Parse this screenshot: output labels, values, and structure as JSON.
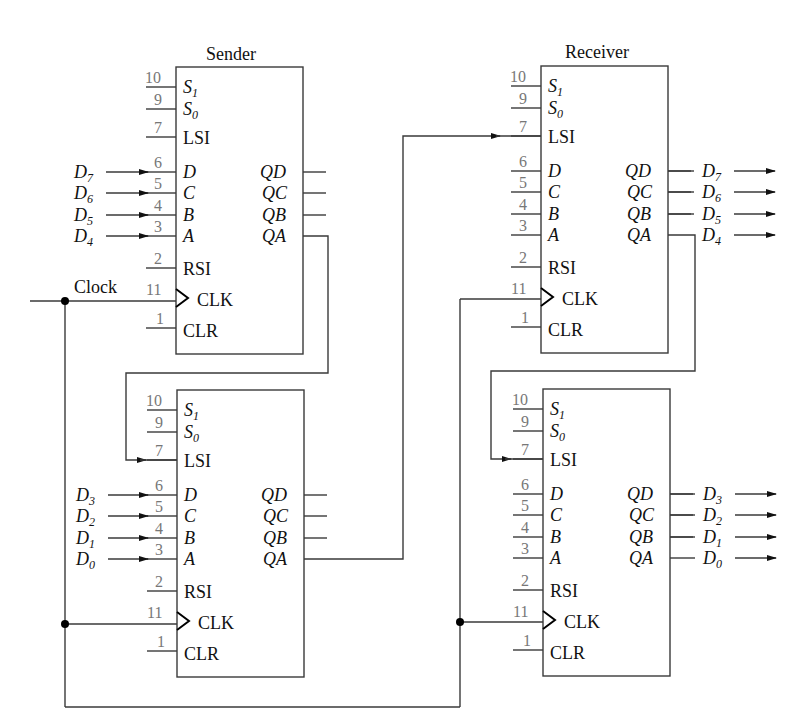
{
  "diagram": {
    "clock_label": "Clock",
    "sender": {
      "title": "Sender",
      "upper": {
        "inputs": [
          {
            "pin": "10",
            "name": "S",
            "sub": "1"
          },
          {
            "pin": "9",
            "name": "S",
            "sub": "0"
          },
          {
            "pin": "7",
            "name": "LSI"
          },
          {
            "pin": "6",
            "name": "D"
          },
          {
            "pin": "5",
            "name": "C"
          },
          {
            "pin": "4",
            "name": "B"
          },
          {
            "pin": "3",
            "name": "A"
          },
          {
            "pin": "2",
            "name": "RSI"
          },
          {
            "pin": "11",
            "name": "CLK"
          },
          {
            "pin": "1",
            "name": "CLR"
          }
        ],
        "outputs": [
          "QD",
          "QC",
          "QB",
          "QA"
        ],
        "data_in": [
          {
            "name": "D",
            "sub": "7"
          },
          {
            "name": "D",
            "sub": "6"
          },
          {
            "name": "D",
            "sub": "5"
          },
          {
            "name": "D",
            "sub": "4"
          }
        ]
      },
      "lower": {
        "data_in": [
          {
            "name": "D",
            "sub": "3"
          },
          {
            "name": "D",
            "sub": "2"
          },
          {
            "name": "D",
            "sub": "1"
          },
          {
            "name": "D",
            "sub": "0"
          }
        ]
      }
    },
    "receiver": {
      "title": "Receiver",
      "upper": {
        "data_out": [
          {
            "name": "D",
            "sub": "7"
          },
          {
            "name": "D",
            "sub": "6"
          },
          {
            "name": "D",
            "sub": "5"
          },
          {
            "name": "D",
            "sub": "4"
          }
        ]
      },
      "lower": {
        "data_out": [
          {
            "name": "D",
            "sub": "3"
          },
          {
            "name": "D",
            "sub": "2"
          },
          {
            "name": "D",
            "sub": "1"
          },
          {
            "name": "D",
            "sub": "0"
          }
        ]
      }
    },
    "pin_labels": {
      "s1": "S",
      "s1_sub": "1",
      "s0": "S",
      "s0_sub": "0",
      "lsi": "LSI",
      "d": "D",
      "c": "C",
      "b": "B",
      "a": "A",
      "rsi": "RSI",
      "clk": "CLK",
      "clr": "CLR",
      "qd": "QD",
      "qc": "QC",
      "qb": "QB",
      "qa": "QA"
    },
    "pin_numbers": {
      "s1": "10",
      "s0": "9",
      "lsi": "7",
      "d": "6",
      "c": "5",
      "b": "4",
      "a": "3",
      "rsi": "2",
      "clk": "11",
      "clr": "1"
    },
    "colors": {
      "line": "#3a3a3a",
      "pin_number": "#777777",
      "text": "#111111"
    }
  }
}
